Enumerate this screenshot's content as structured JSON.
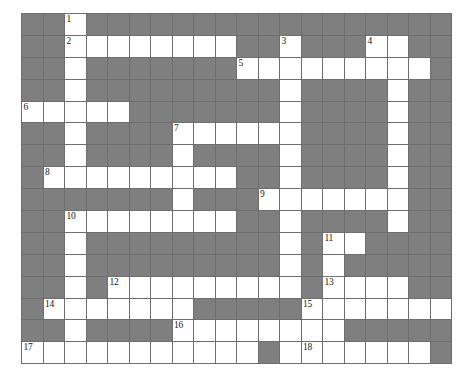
{
  "puzzle": {
    "kind": "crossword-grid",
    "rows": 16,
    "cols": 20,
    "cell_size_px": 21.5,
    "colors": {
      "block": "#7f7f7f",
      "open": "#ffffff",
      "grid_line": "#6e6e6e",
      "number": "#151515",
      "page_background": "#ffffff"
    },
    "numbers_present": [
      "1",
      "2",
      "3",
      "4",
      "5",
      "6",
      "7",
      "8",
      "9",
      "10",
      "11",
      "12",
      "13",
      "14",
      "15",
      "16",
      "17",
      "18"
    ],
    "clue_numbers": [
      {
        "label": "1",
        "row": 1,
        "col": 3
      },
      {
        "label": "2",
        "row": 2,
        "col": 3
      },
      {
        "label": "3",
        "row": 2,
        "col": 13
      },
      {
        "label": "4",
        "row": 2,
        "col": 17
      },
      {
        "label": "5",
        "row": 3,
        "col": 11
      },
      {
        "label": "6",
        "row": 5,
        "col": 1
      },
      {
        "label": "7",
        "row": 6,
        "col": 8
      },
      {
        "label": "8",
        "row": 8,
        "col": 2
      },
      {
        "label": "9",
        "row": 9,
        "col": 12
      },
      {
        "label": "10",
        "row": 10,
        "col": 3
      },
      {
        "label": "11",
        "row": 11,
        "col": 15
      },
      {
        "label": "12",
        "row": 13,
        "col": 5
      },
      {
        "label": "13",
        "row": 13,
        "col": 15
      },
      {
        "label": "14",
        "row": 14,
        "col": 2
      },
      {
        "label": "15",
        "row": 14,
        "col": 14
      },
      {
        "label": "16",
        "row": 15,
        "col": 8
      },
      {
        "label": "17",
        "row": 16,
        "col": 1
      },
      {
        "label": "18",
        "row": 16,
        "col": 14
      }
    ],
    "grid": [
      [
        0,
        0,
        1,
        0,
        0,
        0,
        0,
        0,
        0,
        0,
        0,
        0,
        0,
        0,
        0,
        0,
        0,
        0,
        0,
        0
      ],
      [
        0,
        0,
        1,
        1,
        1,
        1,
        1,
        1,
        1,
        1,
        0,
        0,
        1,
        0,
        0,
        0,
        1,
        1,
        0,
        0
      ],
      [
        0,
        0,
        1,
        0,
        0,
        0,
        0,
        0,
        0,
        0,
        1,
        1,
        1,
        1,
        1,
        1,
        1,
        1,
        1,
        0
      ],
      [
        0,
        0,
        1,
        0,
        0,
        0,
        0,
        0,
        0,
        0,
        0,
        0,
        1,
        0,
        0,
        0,
        0,
        1,
        0,
        0
      ],
      [
        1,
        1,
        1,
        1,
        1,
        0,
        0,
        0,
        0,
        0,
        0,
        0,
        1,
        0,
        0,
        0,
        0,
        1,
        0,
        0
      ],
      [
        0,
        0,
        1,
        0,
        0,
        0,
        0,
        1,
        1,
        1,
        1,
        1,
        1,
        0,
        0,
        0,
        0,
        1,
        0,
        0
      ],
      [
        0,
        0,
        1,
        0,
        0,
        0,
        0,
        1,
        0,
        0,
        0,
        0,
        1,
        0,
        0,
        0,
        0,
        1,
        0,
        0
      ],
      [
        0,
        1,
        1,
        1,
        1,
        1,
        1,
        1,
        1,
        1,
        0,
        0,
        1,
        0,
        0,
        0,
        0,
        1,
        0,
        0
      ],
      [
        0,
        0,
        0,
        0,
        0,
        0,
        0,
        1,
        0,
        0,
        0,
        1,
        1,
        1,
        1,
        1,
        1,
        1,
        0,
        0
      ],
      [
        0,
        0,
        1,
        1,
        1,
        1,
        1,
        1,
        1,
        1,
        0,
        0,
        1,
        0,
        0,
        0,
        0,
        1,
        0,
        0
      ],
      [
        0,
        0,
        1,
        0,
        0,
        0,
        0,
        0,
        0,
        0,
        0,
        0,
        1,
        0,
        1,
        1,
        0,
        0,
        0,
        0
      ],
      [
        0,
        0,
        1,
        0,
        0,
        0,
        0,
        0,
        0,
        0,
        0,
        0,
        1,
        0,
        1,
        0,
        0,
        0,
        0,
        0
      ],
      [
        0,
        0,
        1,
        0,
        1,
        1,
        1,
        1,
        1,
        1,
        1,
        1,
        1,
        0,
        1,
        1,
        1,
        1,
        0,
        0
      ],
      [
        0,
        1,
        1,
        1,
        1,
        1,
        1,
        1,
        0,
        0,
        0,
        0,
        0,
        1,
        1,
        1,
        1,
        1,
        1,
        1
      ],
      [
        0,
        0,
        1,
        0,
        0,
        0,
        0,
        1,
        1,
        1,
        1,
        1,
        1,
        1,
        1,
        0,
        0,
        0,
        0,
        0
      ],
      [
        1,
        1,
        1,
        1,
        1,
        1,
        1,
        1,
        1,
        1,
        1,
        0,
        1,
        1,
        1,
        1,
        1,
        1,
        1,
        0
      ]
    ]
  }
}
